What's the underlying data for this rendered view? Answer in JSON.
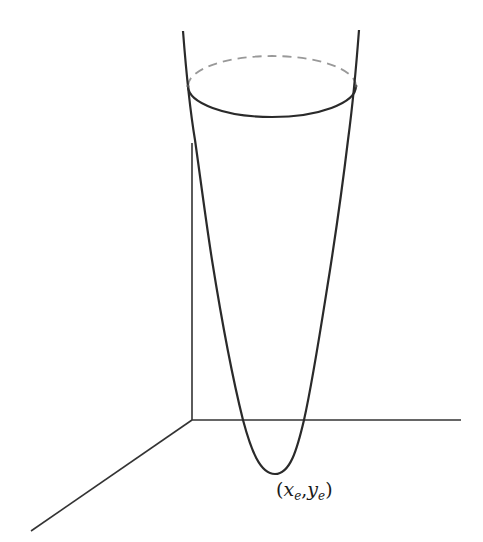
{
  "diagram": {
    "type": "3d-paraboloid",
    "vertex_label": {
      "open": "(",
      "x": "x",
      "x_sub": "e",
      "sep": ",",
      "y": "y",
      "y_sub": "e",
      "close": ")"
    },
    "colors": {
      "curve": "#2a2a2a",
      "axes": "#333333",
      "dashed": "#999999",
      "background": "#ffffff"
    }
  }
}
